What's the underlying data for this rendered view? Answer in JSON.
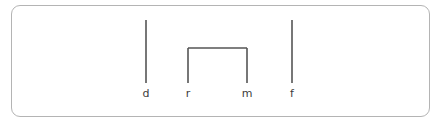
{
  "figure": {
    "background_color": "#ffffff",
    "stroke_color": "#555555",
    "border_color": "#b4b4b4",
    "label_color": "#3c3c3c",
    "stroke_width": 1.6,
    "border_radius": 9
  },
  "chart_data": {
    "type": "diagram",
    "title": "",
    "xlabel": "",
    "ylabel": "",
    "grid": false,
    "legend": null,
    "stems": [
      {
        "label": "d",
        "x": 146,
        "y_top": 20,
        "y_bottom": 83,
        "height": 63,
        "grouped": false
      },
      {
        "label": "r",
        "x": 188,
        "y_top": 48,
        "y_bottom": 83,
        "height": 35,
        "grouped": true
      },
      {
        "label": "m",
        "x": 247,
        "y_top": 48,
        "y_bottom": 83,
        "height": 35,
        "grouped": true
      },
      {
        "label": "f",
        "x": 292,
        "y_top": 20,
        "y_bottom": 83,
        "height": 63,
        "grouped": false
      }
    ],
    "brackets": [
      {
        "from": "r",
        "to": "m",
        "x_left": 188,
        "x_right": 247,
        "y": 48
      }
    ],
    "labels": [
      "d",
      "r",
      "m",
      "f"
    ],
    "label_baseline_y": 97
  },
  "labels": {
    "d": "d",
    "r": "r",
    "m": "m",
    "f": "f"
  }
}
